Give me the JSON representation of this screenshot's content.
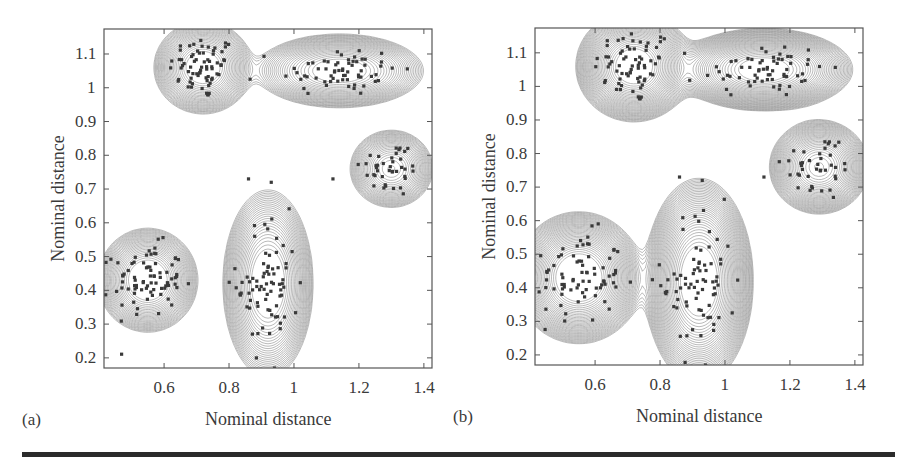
{
  "figure": {
    "panels": [
      {
        "tag": "(a)",
        "xlabel": "Nominal distance",
        "ylabel": "Nominal distance",
        "box": {
          "left": 104,
          "top": 29,
          "right": 432,
          "bottom": 368
        },
        "xlim": [
          0.415,
          1.425
        ],
        "ylim": [
          0.17,
          1.174
        ],
        "xticks": [
          "0.6",
          "0.8",
          "1",
          "1.2",
          "1.4"
        ],
        "yticks": [
          "0.2",
          "0.3",
          "0.4",
          "0.5",
          "0.6",
          "0.7",
          "0.8",
          "0.9",
          "1",
          "1.1"
        ],
        "bandwidth_scale": 1.0
      },
      {
        "tag": "(b)",
        "xlabel": "Nominal distance",
        "ylabel": "Nominal distance",
        "box": {
          "left": 535,
          "top": 28,
          "right": 863,
          "bottom": 365
        },
        "xlim": [
          0.415,
          1.425
        ],
        "ylim": [
          0.17,
          1.174
        ],
        "xticks": [
          "0.6",
          "0.8",
          "1",
          "1.2",
          "1.4"
        ],
        "yticks": [
          "0.2",
          "0.3",
          "0.4",
          "0.5",
          "0.6",
          "0.7",
          "0.8",
          "0.9",
          "1",
          "1.1"
        ],
        "bandwidth_scale": 1.25
      }
    ],
    "colors": {
      "contour": "#8a8a8a",
      "point": "#3a3a3a",
      "axis": "#555555",
      "rule": "#2b2b2b"
    }
  },
  "chart_data": [
    {
      "type": "scatter",
      "subtype": "contour",
      "title": "(a)",
      "xlabel": "Nominal distance",
      "ylabel": "Nominal distance",
      "xlim": [
        0.415,
        1.425
      ],
      "ylim": [
        0.17,
        1.174
      ],
      "xticks": [
        0.6,
        0.8,
        1.0,
        1.2,
        1.4
      ],
      "yticks": [
        0.2,
        0.3,
        0.4,
        0.5,
        0.6,
        0.7,
        0.8,
        0.9,
        1.0,
        1.1
      ],
      "grid": false,
      "legend": null,
      "clusters": [
        {
          "name": "cluster-1",
          "center": [
            0.72,
            1.06
          ],
          "spread": [
            0.055,
            0.05
          ],
          "n": 70
        },
        {
          "name": "cluster-2",
          "center": [
            1.14,
            1.05
          ],
          "spread": [
            0.095,
            0.04
          ],
          "n": 65
        },
        {
          "name": "cluster-3",
          "center": [
            1.3,
            0.76
          ],
          "spread": [
            0.05,
            0.045
          ],
          "n": 40
        },
        {
          "name": "cluster-4",
          "center": [
            0.55,
            0.43
          ],
          "spread": [
            0.055,
            0.055
          ],
          "n": 80
        },
        {
          "name": "cluster-5",
          "center": [
            0.92,
            0.42
          ],
          "spread": [
            0.05,
            0.1
          ],
          "n": 75
        }
      ],
      "outliers": [
        [
          0.86,
          0.73
        ],
        [
          0.93,
          0.72
        ],
        [
          1.12,
          0.73
        ],
        [
          0.94,
          0.17
        ]
      ]
    },
    {
      "type": "scatter",
      "subtype": "contour",
      "title": "(b)",
      "xlabel": "Nominal distance",
      "ylabel": "Nominal distance",
      "xlim": [
        0.415,
        1.425
      ],
      "ylim": [
        0.17,
        1.174
      ],
      "xticks": [
        0.6,
        0.8,
        1.0,
        1.2,
        1.4
      ],
      "yticks": [
        0.2,
        0.3,
        0.4,
        0.5,
        0.6,
        0.7,
        0.8,
        0.9,
        1.0,
        1.1
      ],
      "grid": false,
      "legend": null,
      "clusters": [
        {
          "name": "cluster-1",
          "center": [
            0.72,
            1.06
          ],
          "spread": [
            0.065,
            0.06
          ],
          "n": 70
        },
        {
          "name": "cluster-2",
          "center": [
            1.12,
            1.05
          ],
          "spread": [
            0.1,
            0.045
          ],
          "n": 65
        },
        {
          "name": "cluster-3",
          "center": [
            1.29,
            0.76
          ],
          "spread": [
            0.06,
            0.055
          ],
          "n": 40
        },
        {
          "name": "cluster-4",
          "center": [
            0.55,
            0.43
          ],
          "spread": [
            0.07,
            0.07
          ],
          "n": 80
        },
        {
          "name": "cluster-5",
          "center": [
            0.92,
            0.42
          ],
          "spread": [
            0.06,
            0.11
          ],
          "n": 75
        }
      ],
      "outliers": [
        [
          0.86,
          0.73
        ],
        [
          0.93,
          0.72
        ],
        [
          1.12,
          0.73
        ],
        [
          0.94,
          0.17
        ]
      ]
    }
  ]
}
